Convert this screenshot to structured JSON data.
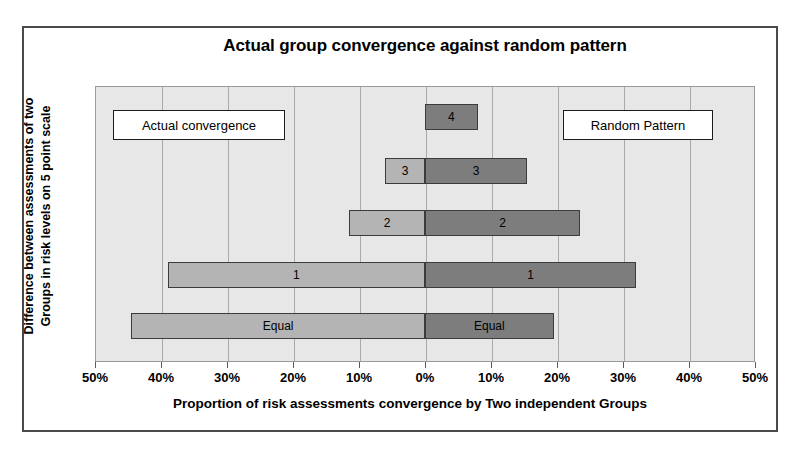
{
  "chart_data": {
    "type": "bar",
    "orientation": "horizontal-diverging",
    "title": "Actual group convergence against random pattern",
    "xlabel": "Proportion of risk assessments convergence by Two independent Groups",
    "ylabel": "Difference between assessments of two Groups in risk levels on 5 point scale",
    "ylabel_line1": "Difference between assessments of two",
    "ylabel_line2": "Groups in risk levels on 5 point scale",
    "categories": [
      "4",
      "3",
      "2",
      "1",
      "Equal"
    ],
    "xlim": [
      -50,
      50
    ],
    "xtick_values": [
      -50,
      -40,
      -30,
      -20,
      -10,
      0,
      10,
      20,
      30,
      40,
      50
    ],
    "xtick_labels": [
      "50%",
      "40%",
      "30%",
      "20%",
      "10%",
      "0%",
      "10%",
      "20%",
      "30%",
      "40%",
      "50%"
    ],
    "grid": true,
    "legend_position": "inside-plot",
    "series": [
      {
        "name": "Actual convergence",
        "side": "left",
        "color": "#b4b4b4",
        "values": [
          0,
          6,
          11.5,
          39,
          44.5
        ]
      },
      {
        "name": "Random Pattern",
        "side": "right",
        "color": "#7d7d7d",
        "values": [
          8,
          15.5,
          23.5,
          32,
          19.5
        ]
      }
    ],
    "bars": [
      {
        "category": "4",
        "left_value": 0,
        "right_value": 8,
        "left_label": "",
        "right_label": "4"
      },
      {
        "category": "3",
        "left_value": 6,
        "right_value": 15.5,
        "left_label": "3",
        "right_label": "3"
      },
      {
        "category": "2",
        "left_value": 11.5,
        "right_value": 23.5,
        "left_label": "2",
        "right_label": "2"
      },
      {
        "category": "1",
        "left_value": 39,
        "right_value": 32,
        "left_label": "1",
        "right_label": "1"
      },
      {
        "category": "Equal",
        "left_value": 44.5,
        "right_value": 19.5,
        "left_label": "Equal",
        "right_label": "Equal"
      }
    ]
  },
  "legend": {
    "actual_label": "Actual convergence",
    "random_label": "Random Pattern"
  },
  "colors": {
    "bar_left": "#b4b4b4",
    "bar_right": "#7d7d7d",
    "plot_background": "#e7e7e7",
    "gridline": "#a9a9a9",
    "frame": "#4a4a4a"
  }
}
